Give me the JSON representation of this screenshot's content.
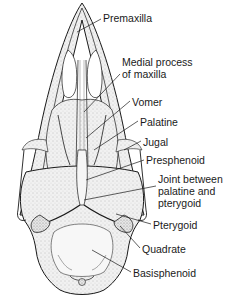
{
  "figure": {
    "labels": [
      {
        "id": "premaxilla",
        "lines": [
          "Premaxilla"
        ],
        "x": 103,
        "y": 12
      },
      {
        "id": "medial-process-of-maxilla",
        "lines": [
          "Medial process",
          "of maxilla"
        ],
        "x": 122,
        "y": 56
      },
      {
        "id": "vomer",
        "lines": [
          "Vomer"
        ],
        "x": 132,
        "y": 96
      },
      {
        "id": "palatine",
        "lines": [
          "Palatine"
        ],
        "x": 140,
        "y": 116
      },
      {
        "id": "jugal",
        "lines": [
          "Jugal"
        ],
        "x": 143,
        "y": 136
      },
      {
        "id": "presphenoid",
        "lines": [
          "Presphenoid"
        ],
        "x": 146,
        "y": 154
      },
      {
        "id": "joint-between-palatine-and-pterygoid",
        "lines": [
          "Joint between",
          "palatine and",
          "pterygoid"
        ],
        "x": 158,
        "y": 173
      },
      {
        "id": "pterygoid",
        "lines": [
          "Pterygoid"
        ],
        "x": 153,
        "y": 220
      },
      {
        "id": "quadrate",
        "lines": [
          "Quadrate"
        ],
        "x": 142,
        "y": 244
      },
      {
        "id": "basisphenoid",
        "lines": [
          "Basisphenoid"
        ],
        "x": 133,
        "y": 268
      }
    ],
    "colors": {
      "ink": "#1a1a1a",
      "bone_fill": "#e9e9e9",
      "stipple": "#8a8a8a",
      "background": "#ffffff"
    }
  }
}
